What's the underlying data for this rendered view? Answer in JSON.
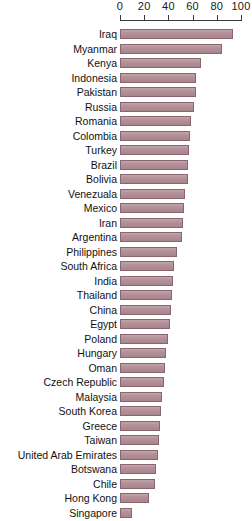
{
  "chart_data": {
    "type": "bar",
    "orientation": "horizontal",
    "title": "",
    "subtitle": "",
    "xlabel": "",
    "ylabel": "",
    "xlim": [
      0,
      100
    ],
    "grid": false,
    "legend": null,
    "axis_ticks": [
      0,
      20,
      40,
      60,
      80,
      100
    ],
    "axis_tick_labels": [
      "0",
      "20",
      "40",
      "60",
      "80",
      "100"
    ],
    "categories": [
      "Iraq",
      "Myanmar",
      "Kenya",
      "Indonesia",
      "Pakistan",
      "Russia",
      "Romania",
      "Colombia",
      "Turkey",
      "Brazil",
      "Bolivia",
      "Venezuala",
      "Mexico",
      "Iran",
      "Argentina",
      "Philippines",
      "South Africa",
      "India",
      "Thailand",
      "China",
      "Egypt",
      "Poland",
      "Hungary",
      "Oman",
      "Czech Republic",
      "Malaysia",
      "South Korea",
      "Greece",
      "Taiwan",
      "United Arab Emirates",
      "Botswana",
      "Chile",
      "Hong Kong",
      "Singapore"
    ],
    "values": [
      93,
      84,
      67,
      63,
      63,
      61,
      59,
      58,
      57,
      56,
      56,
      54,
      53,
      52,
      51,
      47,
      45,
      44,
      43,
      42,
      41,
      40,
      38,
      37,
      36,
      35,
      34,
      33,
      32,
      31,
      30,
      29,
      24,
      10
    ]
  },
  "style": {
    "bar_fill": "#b18c94",
    "bar_border": "#8a6471",
    "axis_color": "#3a3a3a",
    "text_color": "#111111",
    "background": "#ffffff"
  }
}
